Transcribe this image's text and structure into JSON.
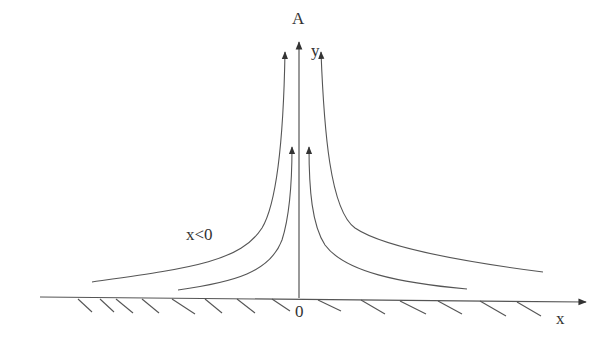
{
  "labels": {
    "point_a": "A",
    "y_axis": "y",
    "x_axis": "x",
    "origin": "0",
    "region": "x<0"
  },
  "colors": {
    "stroke": "#555555",
    "text": "#333333",
    "background": "#ffffff"
  },
  "streamlines": [
    {
      "name": "outer-left",
      "side": "left"
    },
    {
      "name": "inner-left",
      "side": "left"
    },
    {
      "name": "inner-right",
      "side": "right"
    },
    {
      "name": "outer-right",
      "side": "right"
    }
  ]
}
